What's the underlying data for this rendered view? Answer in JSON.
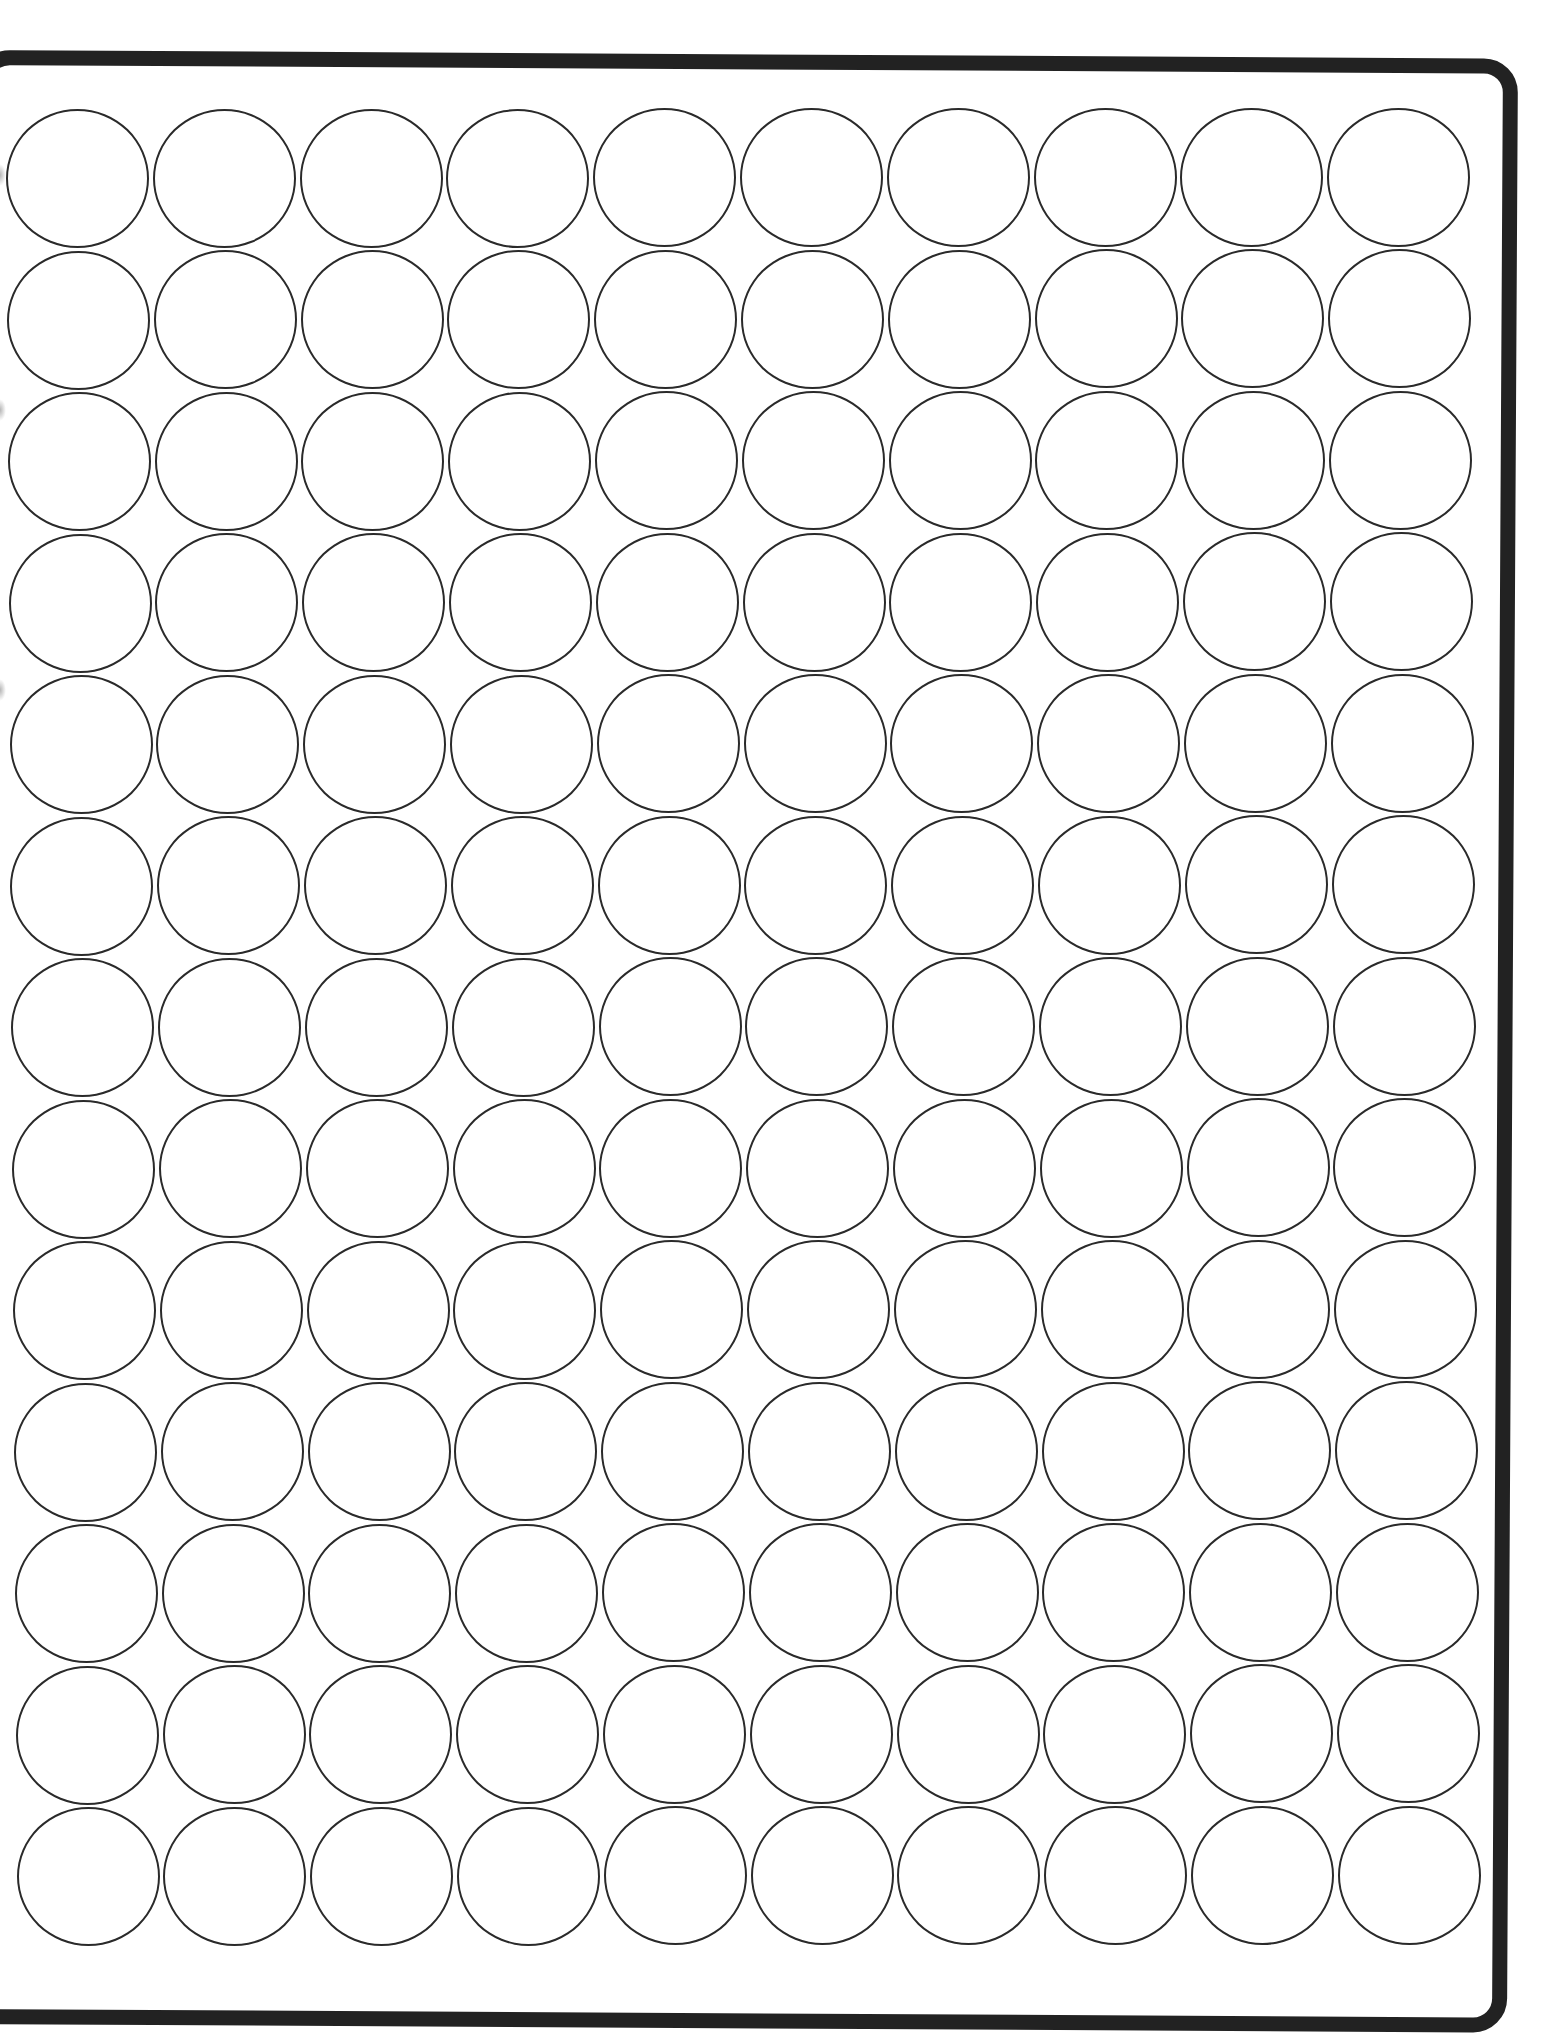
{
  "sheet": {
    "type": "round label template",
    "columns": 10,
    "rows": 13,
    "total_labels": 130,
    "label_shape": "circle",
    "frame_color": "#222222",
    "circle_stroke_color": "#2a2a2a",
    "background_color": "#ffffff"
  },
  "layout": {
    "origin_x": 6,
    "origin_y": 109,
    "col_pitch": 146.8,
    "row_pitch": 141.5,
    "row_x_drift": 0.88,
    "col_y_drift": -0.15
  },
  "artifacts": {
    "scan_smudges_y": [
      175,
      410,
      690
    ]
  }
}
